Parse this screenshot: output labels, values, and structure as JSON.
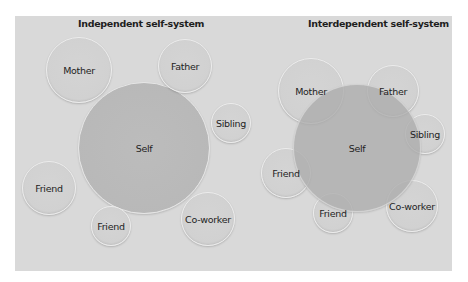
{
  "colors": {
    "background": "#ffffff",
    "panel": "#d9d9d9",
    "node_fill": "#d2d2d2",
    "node_rim": "#ececec",
    "self_fill": "#b8b8b8",
    "text": "#1e1e1e"
  },
  "independent": {
    "title": "Independent self-system",
    "self": {
      "label": "Self",
      "cx": 144,
      "cy": 148,
      "r": 66
    },
    "nodes": [
      {
        "label": "Mother",
        "cx": 79,
        "cy": 70,
        "r": 33
      },
      {
        "label": "Father",
        "cx": 185,
        "cy": 66,
        "r": 27
      },
      {
        "label": "Sibling",
        "cx": 231,
        "cy": 123,
        "r": 20
      },
      {
        "label": "Friend",
        "cx": 49,
        "cy": 188,
        "r": 27
      },
      {
        "label": "Friend",
        "cx": 111,
        "cy": 226,
        "r": 20
      },
      {
        "label": "Co-worker",
        "cx": 208,
        "cy": 219,
        "r": 27
      }
    ]
  },
  "interdependent": {
    "title": "Interdependent self-system",
    "self": {
      "label": "Self",
      "cx": 357,
      "cy": 148,
      "r": 64
    },
    "nodes": [
      {
        "label": "Mother",
        "cx": 311,
        "cy": 91,
        "r": 33
      },
      {
        "label": "Father",
        "cx": 393,
        "cy": 91,
        "r": 26
      },
      {
        "label": "Sibling",
        "cx": 425,
        "cy": 134,
        "r": 20
      },
      {
        "label": "Friend",
        "cx": 286,
        "cy": 173,
        "r": 25
      },
      {
        "label": "Friend",
        "cx": 333,
        "cy": 213,
        "r": 20
      },
      {
        "label": "Co-worker",
        "cx": 412,
        "cy": 206,
        "r": 26
      }
    ]
  }
}
